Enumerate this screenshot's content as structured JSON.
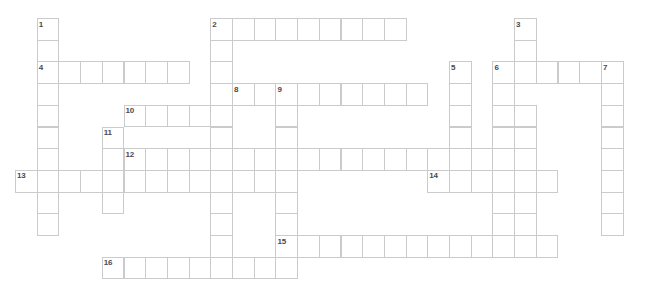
{
  "puzzle": {
    "title": "Crossword Puzzle Grid",
    "cell_size": 21.7,
    "origin_x": 15,
    "origin_y": 18,
    "grid_line_color": "#c9cbcd",
    "cell_fill_color": "#ffffff",
    "number_color": "#4a4a4a",
    "background_color": "#ffffff",
    "columns": 30,
    "rows": 12,
    "entries": [
      {
        "number": "1",
        "direction": "down",
        "row": 0,
        "col": 1,
        "length": 10
      },
      {
        "number": "2",
        "direction": "across",
        "row": 0,
        "col": 9,
        "length": 9
      },
      {
        "number": "2",
        "direction": "down",
        "row": 0,
        "col": 9,
        "length": 12
      },
      {
        "number": "3",
        "direction": "down",
        "row": 0,
        "col": 23,
        "length": 11
      },
      {
        "number": "4",
        "direction": "across",
        "row": 2,
        "col": 1,
        "length": 7
      },
      {
        "number": "5",
        "direction": "down",
        "row": 2,
        "col": 20,
        "length": 4
      },
      {
        "number": "6",
        "direction": "across",
        "row": 2,
        "col": 22,
        "length": 6
      },
      {
        "number": "6",
        "direction": "down",
        "row": 2,
        "col": 22,
        "length": 9
      },
      {
        "number": "7",
        "direction": "down",
        "row": 2,
        "col": 27,
        "length": 9
      },
      {
        "number": "8",
        "direction": "across",
        "row": 3,
        "col": 10,
        "length": 9
      },
      {
        "number": "9",
        "direction": "down",
        "row": 3,
        "col": 12,
        "length": 8
      },
      {
        "number": "10",
        "direction": "across",
        "row": 4,
        "col": 5,
        "length": 5
      },
      {
        "number": "11",
        "direction": "down",
        "row": 5,
        "col": 4,
        "length": 4
      },
      {
        "number": "12",
        "direction": "across",
        "row": 6,
        "col": 5,
        "length": 17
      },
      {
        "number": "12",
        "direction": "down",
        "row": 6,
        "col": 5,
        "length": 4
      },
      {
        "number": "13",
        "direction": "across",
        "row": 7,
        "col": 0,
        "length": 12
      },
      {
        "number": "14",
        "direction": "across",
        "row": 7,
        "col": 19,
        "length": 6
      },
      {
        "number": "15",
        "direction": "across",
        "row": 10,
        "col": 12,
        "length": 13
      },
      {
        "number": "16",
        "direction": "across",
        "row": 11,
        "col": 4,
        "length": 9
      }
    ],
    "cells": [
      {
        "row": 0,
        "col": 1,
        "num": "1"
      },
      {
        "row": 0,
        "col": 9,
        "num": "2"
      },
      {
        "row": 0,
        "col": 10,
        "num": ""
      },
      {
        "row": 0,
        "col": 11,
        "num": ""
      },
      {
        "row": 0,
        "col": 12,
        "num": ""
      },
      {
        "row": 0,
        "col": 13,
        "num": ""
      },
      {
        "row": 0,
        "col": 14,
        "num": ""
      },
      {
        "row": 0,
        "col": 15,
        "num": ""
      },
      {
        "row": 0,
        "col": 16,
        "num": ""
      },
      {
        "row": 0,
        "col": 17,
        "num": ""
      },
      {
        "row": 0,
        "col": 23,
        "num": "3"
      },
      {
        "row": 1,
        "col": 1,
        "num": ""
      },
      {
        "row": 1,
        "col": 9,
        "num": ""
      },
      {
        "row": 1,
        "col": 23,
        "num": ""
      },
      {
        "row": 2,
        "col": 1,
        "num": "4"
      },
      {
        "row": 2,
        "col": 2,
        "num": ""
      },
      {
        "row": 2,
        "col": 3,
        "num": ""
      },
      {
        "row": 2,
        "col": 4,
        "num": ""
      },
      {
        "row": 2,
        "col": 5,
        "num": ""
      },
      {
        "row": 2,
        "col": 6,
        "num": ""
      },
      {
        "row": 2,
        "col": 7,
        "num": ""
      },
      {
        "row": 2,
        "col": 9,
        "num": ""
      },
      {
        "row": 2,
        "col": 20,
        "num": "5"
      },
      {
        "row": 2,
        "col": 22,
        "num": "6"
      },
      {
        "row": 2,
        "col": 23,
        "num": ""
      },
      {
        "row": 2,
        "col": 24,
        "num": ""
      },
      {
        "row": 2,
        "col": 25,
        "num": ""
      },
      {
        "row": 2,
        "col": 26,
        "num": ""
      },
      {
        "row": 2,
        "col": 27,
        "num": "7"
      },
      {
        "row": 3,
        "col": 1,
        "num": ""
      },
      {
        "row": 3,
        "col": 9,
        "num": ""
      },
      {
        "row": 3,
        "col": 10,
        "num": "8"
      },
      {
        "row": 3,
        "col": 11,
        "num": ""
      },
      {
        "row": 3,
        "col": 12,
        "num": "9"
      },
      {
        "row": 3,
        "col": 13,
        "num": ""
      },
      {
        "row": 3,
        "col": 14,
        "num": ""
      },
      {
        "row": 3,
        "col": 15,
        "num": ""
      },
      {
        "row": 3,
        "col": 16,
        "num": ""
      },
      {
        "row": 3,
        "col": 17,
        "num": ""
      },
      {
        "row": 3,
        "col": 18,
        "num": ""
      },
      {
        "row": 3,
        "col": 20,
        "num": ""
      },
      {
        "row": 3,
        "col": 22,
        "num": ""
      },
      {
        "row": 3,
        "col": 27,
        "num": ""
      },
      {
        "row": 4,
        "col": 1,
        "num": ""
      },
      {
        "row": 4,
        "col": 5,
        "num": "10"
      },
      {
        "row": 4,
        "col": 6,
        "num": ""
      },
      {
        "row": 4,
        "col": 7,
        "num": ""
      },
      {
        "row": 4,
        "col": 8,
        "num": ""
      },
      {
        "row": 4,
        "col": 9,
        "num": ""
      },
      {
        "row": 4,
        "col": 12,
        "num": ""
      },
      {
        "row": 4,
        "col": 20,
        "num": ""
      },
      {
        "row": 4,
        "col": 22,
        "num": ""
      },
      {
        "row": 4,
        "col": 23,
        "num": ""
      },
      {
        "row": 4,
        "col": 27,
        "num": ""
      },
      {
        "row": 5,
        "col": 1,
        "num": ""
      },
      {
        "row": 5,
        "col": 4,
        "num": "11"
      },
      {
        "row": 5,
        "col": 9,
        "num": ""
      },
      {
        "row": 5,
        "col": 12,
        "num": ""
      },
      {
        "row": 5,
        "col": 20,
        "num": ""
      },
      {
        "row": 5,
        "col": 22,
        "num": ""
      },
      {
        "row": 5,
        "col": 23,
        "num": ""
      },
      {
        "row": 5,
        "col": 27,
        "num": ""
      },
      {
        "row": 6,
        "col": 1,
        "num": ""
      },
      {
        "row": 6,
        "col": 4,
        "num": ""
      },
      {
        "row": 6,
        "col": 5,
        "num": "12"
      },
      {
        "row": 6,
        "col": 6,
        "num": ""
      },
      {
        "row": 6,
        "col": 7,
        "num": ""
      },
      {
        "row": 6,
        "col": 8,
        "num": ""
      },
      {
        "row": 6,
        "col": 9,
        "num": ""
      },
      {
        "row": 6,
        "col": 10,
        "num": ""
      },
      {
        "row": 6,
        "col": 11,
        "num": ""
      },
      {
        "row": 6,
        "col": 12,
        "num": ""
      },
      {
        "row": 6,
        "col": 13,
        "num": ""
      },
      {
        "row": 6,
        "col": 14,
        "num": ""
      },
      {
        "row": 6,
        "col": 15,
        "num": ""
      },
      {
        "row": 6,
        "col": 16,
        "num": ""
      },
      {
        "row": 6,
        "col": 17,
        "num": ""
      },
      {
        "row": 6,
        "col": 18,
        "num": ""
      },
      {
        "row": 6,
        "col": 19,
        "num": ""
      },
      {
        "row": 6,
        "col": 20,
        "num": ""
      },
      {
        "row": 6,
        "col": 21,
        "num": ""
      },
      {
        "row": 6,
        "col": 22,
        "num": ""
      },
      {
        "row": 6,
        "col": 23,
        "num": ""
      },
      {
        "row": 6,
        "col": 27,
        "num": ""
      },
      {
        "row": 7,
        "col": 0,
        "num": "13"
      },
      {
        "row": 7,
        "col": 1,
        "num": ""
      },
      {
        "row": 7,
        "col": 2,
        "num": ""
      },
      {
        "row": 7,
        "col": 3,
        "num": ""
      },
      {
        "row": 7,
        "col": 4,
        "num": ""
      },
      {
        "row": 7,
        "col": 5,
        "num": ""
      },
      {
        "row": 7,
        "col": 6,
        "num": ""
      },
      {
        "row": 7,
        "col": 7,
        "num": ""
      },
      {
        "row": 7,
        "col": 8,
        "num": ""
      },
      {
        "row": 7,
        "col": 9,
        "num": ""
      },
      {
        "row": 7,
        "col": 10,
        "num": ""
      },
      {
        "row": 7,
        "col": 11,
        "num": ""
      },
      {
        "row": 7,
        "col": 12,
        "num": ""
      },
      {
        "row": 7,
        "col": 19,
        "num": "14"
      },
      {
        "row": 7,
        "col": 20,
        "num": ""
      },
      {
        "row": 7,
        "col": 21,
        "num": ""
      },
      {
        "row": 7,
        "col": 22,
        "num": ""
      },
      {
        "row": 7,
        "col": 23,
        "num": ""
      },
      {
        "row": 7,
        "col": 24,
        "num": ""
      },
      {
        "row": 7,
        "col": 27,
        "num": ""
      },
      {
        "row": 8,
        "col": 1,
        "num": ""
      },
      {
        "row": 8,
        "col": 4,
        "num": ""
      },
      {
        "row": 8,
        "col": 9,
        "num": ""
      },
      {
        "row": 8,
        "col": 12,
        "num": ""
      },
      {
        "row": 8,
        "col": 22,
        "num": ""
      },
      {
        "row": 8,
        "col": 23,
        "num": ""
      },
      {
        "row": 8,
        "col": 27,
        "num": ""
      },
      {
        "row": 9,
        "col": 1,
        "num": ""
      },
      {
        "row": 9,
        "col": 9,
        "num": ""
      },
      {
        "row": 9,
        "col": 12,
        "num": ""
      },
      {
        "row": 9,
        "col": 22,
        "num": ""
      },
      {
        "row": 9,
        "col": 23,
        "num": ""
      },
      {
        "row": 9,
        "col": 27,
        "num": ""
      },
      {
        "row": 10,
        "col": 9,
        "num": ""
      },
      {
        "row": 10,
        "col": 12,
        "num": "15"
      },
      {
        "row": 10,
        "col": 13,
        "num": ""
      },
      {
        "row": 10,
        "col": 14,
        "num": ""
      },
      {
        "row": 10,
        "col": 15,
        "num": ""
      },
      {
        "row": 10,
        "col": 16,
        "num": ""
      },
      {
        "row": 10,
        "col": 17,
        "num": ""
      },
      {
        "row": 10,
        "col": 18,
        "num": ""
      },
      {
        "row": 10,
        "col": 19,
        "num": ""
      },
      {
        "row": 10,
        "col": 20,
        "num": ""
      },
      {
        "row": 10,
        "col": 21,
        "num": ""
      },
      {
        "row": 10,
        "col": 22,
        "num": ""
      },
      {
        "row": 10,
        "col": 23,
        "num": ""
      },
      {
        "row": 10,
        "col": 24,
        "num": ""
      },
      {
        "row": 11,
        "col": 4,
        "num": "16"
      },
      {
        "row": 11,
        "col": 5,
        "num": ""
      },
      {
        "row": 11,
        "col": 6,
        "num": ""
      },
      {
        "row": 11,
        "col": 7,
        "num": ""
      },
      {
        "row": 11,
        "col": 8,
        "num": ""
      },
      {
        "row": 11,
        "col": 9,
        "num": ""
      },
      {
        "row": 11,
        "col": 10,
        "num": ""
      },
      {
        "row": 11,
        "col": 11,
        "num": ""
      },
      {
        "row": 11,
        "col": 12,
        "num": ""
      }
    ]
  }
}
